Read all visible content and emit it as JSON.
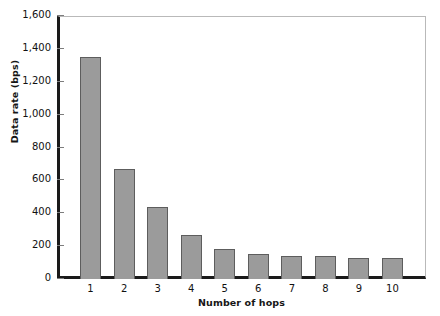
{
  "chart_data": {
    "type": "bar",
    "title": "",
    "xlabel": "Number of hops",
    "ylabel": "Data rate (bps)",
    "categories": [
      "1",
      "2",
      "3",
      "4",
      "5",
      "6",
      "7",
      "8",
      "9",
      "10"
    ],
    "values": [
      1350,
      670,
      440,
      265,
      180,
      150,
      140,
      138,
      130,
      128
    ],
    "ylim": [
      0,
      1600
    ],
    "xlim": [
      0,
      11
    ],
    "ytick_values": [
      0,
      200,
      400,
      600,
      800,
      1000,
      1200,
      1400,
      1600
    ],
    "ytick_labels": [
      "0",
      "200",
      "400",
      "600",
      "800",
      "1,000",
      "1,200",
      "1,400",
      "1,600"
    ],
    "grid": false,
    "legend": null,
    "bar_color": "#9b9b9b",
    "bar_edge_color": "#5d5d5d",
    "axis_color": "#1a1a1a",
    "frame_color": "#b9b9b9"
  }
}
